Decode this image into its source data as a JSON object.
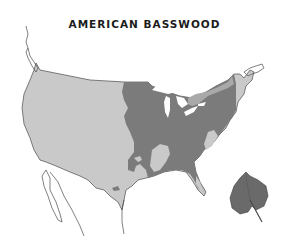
{
  "title": "AMERICAN BASSWOOD",
  "map": {
    "region": "Contiguous United States",
    "legend": [],
    "colors": {
      "background": "#ffffff",
      "non_range": "#c9c9c9",
      "range": "#7b7b7b",
      "coast_outline": "#4a4a4a",
      "water": "#ffffff",
      "leaf": "#6a6a6a"
    },
    "layers": [
      {
        "name": "non-native-area",
        "description": "Western and southern US outside the species range"
      },
      {
        "name": "native-range",
        "description": "American basswood native range covering eastern and central US"
      },
      {
        "name": "great-lakes",
        "description": "Great Lakes shown in white"
      }
    ]
  },
  "icon": {
    "name": "basswood-leaf",
    "position": "bottom-right"
  }
}
